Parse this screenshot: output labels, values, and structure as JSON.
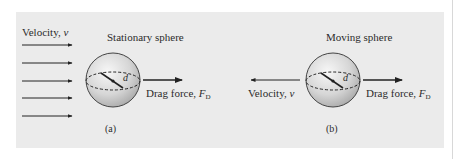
{
  "figure": {
    "panel_color": "#ebebeb",
    "stroke_color": "#222222",
    "panels": [
      {
        "id": "a",
        "title": "Stationary sphere",
        "velocity_label": "Velocity, ",
        "velocity_symbol": "v",
        "velocity_arrow_count": 5,
        "velocity_direction": "right",
        "diameter_symbol": "d",
        "drag_label": "Drag force, ",
        "drag_symbol": "F",
        "drag_subscript": "D",
        "drag_direction": "right",
        "caption": "(a)"
      },
      {
        "id": "b",
        "title": "Moving sphere",
        "velocity_label": "Velocity, ",
        "velocity_symbol": "v",
        "velocity_arrow_count": 1,
        "velocity_direction": "left",
        "diameter_symbol": "d",
        "drag_label": "Drag force, ",
        "drag_symbol": "F",
        "drag_subscript": "D",
        "drag_direction": "right",
        "caption": "(b)"
      }
    ]
  }
}
